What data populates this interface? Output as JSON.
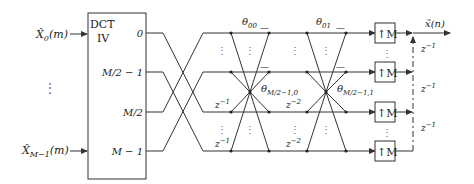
{
  "diagram": {
    "type": "block-diagram",
    "inputs": [
      {
        "label_base": "X̂",
        "subscript": "0",
        "arg": "(m)"
      },
      {
        "label_base": "X̂",
        "subscript": "M−1",
        "arg": "(m)"
      }
    ],
    "input_ellipsis": "⋮",
    "dct_block": {
      "title_line1": "DCT",
      "title_line2": "IV",
      "outputs": [
        "0",
        "M/2 − 1",
        "M/2",
        "M − 1"
      ]
    },
    "stage1_delays": [
      "z⁻¹",
      "z⁻¹"
    ],
    "lattice_stage1": {
      "top_label": "θ",
      "top_sub": "00",
      "mid_label": "θ",
      "mid_sub": "M/2−1,0",
      "delays": [
        "z⁻²",
        "z⁻²"
      ]
    },
    "lattice_stage2": {
      "top_label": "θ",
      "top_sub": "01",
      "mid_label": "θ",
      "mid_sub": "M/2−1,1"
    },
    "minus_sign": "—",
    "upsamplers": [
      "↑M",
      "↑M",
      "↑M",
      "↑M"
    ],
    "output": {
      "label": "x̃(n)"
    },
    "output_delays": [
      "z⁻¹",
      "z⁻¹",
      "z⁻¹"
    ],
    "colors": {
      "line": "#333333",
      "text": "#222222",
      "background": "#ffffff"
    }
  }
}
